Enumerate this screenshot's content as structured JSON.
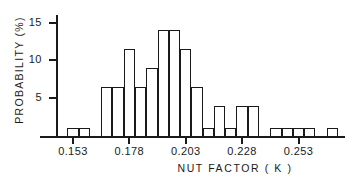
{
  "chart_data": {
    "type": "bar",
    "title": "",
    "subtitle": "",
    "xlabel": "NUT  FACTOR  ( K )",
    "ylabel": "PROBABILITY  (%)",
    "grid": false,
    "legend": null,
    "xlim": [
      0.1455,
      0.2705
    ],
    "ylim": [
      0,
      16
    ],
    "bin_width": 0.005,
    "x_tick_labels": [
      "0.153",
      "0.178",
      "0.203",
      "0.228",
      "0.253"
    ],
    "x_tick_values": [
      0.153,
      0.178,
      0.203,
      0.228,
      0.253
    ],
    "y_tick_labels": [
      "5",
      "10",
      "15"
    ],
    "y_tick_values": [
      5,
      10,
      15
    ],
    "categories": [
      "0.1455-0.1505",
      "0.1505-0.1555",
      "0.1555-0.1605",
      "0.1605-0.1655",
      "0.1655-0.1705",
      "0.1705-0.1755",
      "0.1755-0.1805",
      "0.1805-0.1855",
      "0.1855-0.1905",
      "0.1905-0.1955",
      "0.1955-0.2005",
      "0.2005-0.2055",
      "0.2055-0.2105",
      "0.2105-0.2155",
      "0.2155-0.2205",
      "0.2205-0.2255",
      "0.2255-0.2305",
      "0.2305-0.2355",
      "0.2355-0.2405",
      "0.2405-0.2455",
      "0.2455-0.2505",
      "0.2505-0.2555",
      "0.2555-0.2605",
      "0.2605-0.2655",
      "0.2655-0.2705"
    ],
    "values": [
      0,
      1,
      1,
      0,
      6.5,
      6.5,
      11.5,
      6.5,
      9,
      14,
      14,
      11.5,
      6.5,
      1,
      4,
      1,
      4,
      4,
      0,
      1,
      1,
      1,
      1,
      0,
      1
    ]
  },
  "colors": {
    "ink": "#1a1a1a",
    "background": "#ffffff"
  }
}
